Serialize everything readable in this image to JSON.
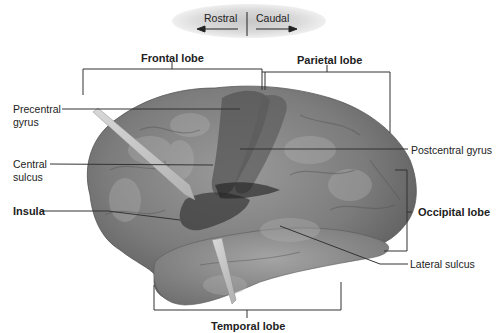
{
  "orientation": {
    "left_label": "Rostral",
    "right_label": "Caudal"
  },
  "labels": {
    "frontal_lobe": "Frontal lobe",
    "parietal_lobe": "Parietal lobe",
    "precentral_gyrus_line1": "Precentral",
    "precentral_gyrus_line2": "gyrus",
    "central_sulcus_line1": "Central",
    "central_sulcus_line2": "sulcus",
    "insula": "Insula",
    "postcentral_gyrus": "Postcentral gyrus",
    "occipital_lobe": "Occipital lobe",
    "lateral_sulcus": "Lateral sulcus",
    "temporal_lobe": "Temporal lobe"
  },
  "colors": {
    "brain_base": "#7a7a7a",
    "brain_dark": "#4a4a4a",
    "brain_light": "#a8a8a8",
    "label_text": "#222222",
    "leader_line": "#333333"
  }
}
